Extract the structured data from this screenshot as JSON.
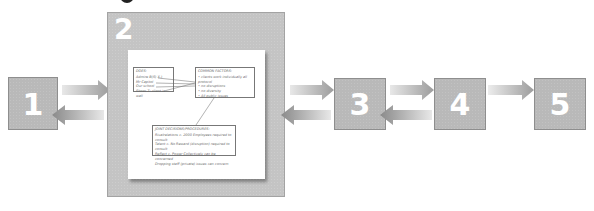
{
  "diagram": {
    "steps": [
      {
        "id": "1",
        "label": "1"
      },
      {
        "id": "2",
        "label": "2"
      },
      {
        "id": "3",
        "label": "3"
      },
      {
        "id": "4",
        "label": "4"
      },
      {
        "id": "5",
        "label": "5"
      }
    ],
    "document": {
      "title": "",
      "does_box": {
        "heading": "DOES:",
        "items": [
          "Admire B(S) X.)",
          "Mr Capitol",
          "Our school",
          "Shoes 7: client is wall"
        ]
      },
      "common_factors_box": {
        "heading": "COMMON FACTORS:",
        "items": [
          "• clients work individually all protocol",
          "• no disruptions",
          "• no diversity",
          "• All public issues"
        ]
      },
      "joint_box": {
        "heading": "JOINT DECISIONS/PROCEDURES:",
        "items": [
          "Rivalrelations c. 2000 Employees required to consult",
          "Talent c. No Reward (disruption) required to consult",
          "Reflect c. Power Collectively can be concerned",
          "Dropping staff (private) issues can concern"
        ]
      }
    },
    "colors": {
      "step_box": "#b9b9b9",
      "panel": "#c4c4c4",
      "arrow": "#a8a8a8",
      "number": "#ffffff"
    }
  }
}
